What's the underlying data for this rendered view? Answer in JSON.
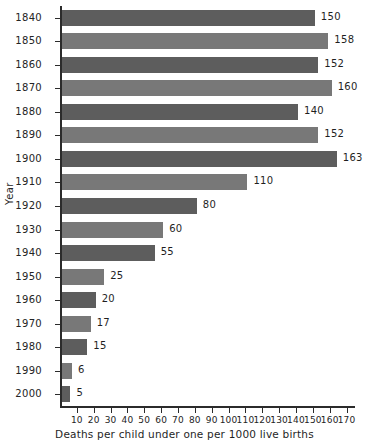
{
  "chart_data": {
    "type": "bar",
    "orientation": "horizontal",
    "title": "",
    "xlabel": "Deaths per child under one per 1000 live births",
    "ylabel": "Year",
    "categories": [
      "1840",
      "1850",
      "1860",
      "1870",
      "1880",
      "1890",
      "1900",
      "1910",
      "1920",
      "1930",
      "1940",
      "1950",
      "1960",
      "1970",
      "1980",
      "1990",
      "2000"
    ],
    "values": [
      150,
      158,
      152,
      160,
      140,
      152,
      163,
      110,
      80,
      60,
      55,
      25,
      20,
      17,
      15,
      6,
      5
    ],
    "value_labels": [
      "150",
      "158",
      "152",
      "160",
      "140",
      "152",
      "163",
      "110",
      "80",
      "60",
      "55",
      "25",
      "20",
      "17",
      "15",
      "6",
      "5"
    ],
    "xlim": [
      0,
      175
    ],
    "xticks": [
      10,
      20,
      30,
      40,
      50,
      60,
      70,
      80,
      90,
      100,
      110,
      120,
      130,
      140,
      150,
      160,
      170
    ],
    "xtick_labels": [
      "10",
      "20",
      "30",
      "40",
      "50",
      "60",
      "70",
      "80",
      "90",
      "100",
      "110",
      "120",
      "130",
      "140",
      "150",
      "160",
      "170"
    ],
    "grid": false,
    "legend": false,
    "bar_colors": [
      "#5d5d5d",
      "#787878"
    ],
    "axis_color": "#2b2b2b"
  }
}
